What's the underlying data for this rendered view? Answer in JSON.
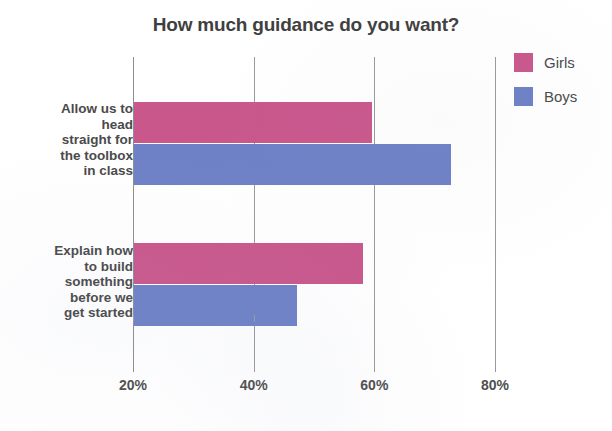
{
  "chart_data": {
    "type": "bar",
    "orientation": "horizontal",
    "title": "How much guidance do you want?",
    "xlabel": "",
    "ylabel": "",
    "xlim": [
      20,
      80
    ],
    "grid": true,
    "legend_position": "top-right",
    "tick_labels": [
      "20%",
      "40%",
      "60%",
      "80%"
    ],
    "tick_values": [
      20,
      40,
      60,
      80
    ],
    "categories": [
      "Allow us to head straight for the toolbox in class",
      "Explain how to build something before we get started"
    ],
    "series": [
      {
        "name": "Girls",
        "color": "#c9578c",
        "values": [
          59.5,
          58.0
        ]
      },
      {
        "name": "Boys",
        "color": "#6e81c6",
        "values": [
          72.5,
          47.0
        ]
      }
    ]
  },
  "legend": {
    "items": [
      {
        "label": "Girls",
        "swatch": "girls-color-swatch"
      },
      {
        "label": "Boys",
        "swatch": "boys-color-swatch"
      }
    ]
  },
  "axis": {
    "ticks": [
      {
        "label": "20%"
      },
      {
        "label": "40%"
      },
      {
        "label": "60%"
      },
      {
        "label": "80%"
      }
    ]
  },
  "categories": [
    {
      "lines": [
        "Allow us to",
        "head",
        "straight for",
        "the toolbox",
        "in class"
      ]
    },
    {
      "lines": [
        "Explain how",
        "to build",
        "something",
        "before we",
        "get started"
      ]
    }
  ],
  "colors": {
    "girls": "#c9578c",
    "boys": "#6e81c6",
    "text": "#4a4a4a",
    "grid": "#9a9a9a",
    "background": "#ffffff"
  }
}
